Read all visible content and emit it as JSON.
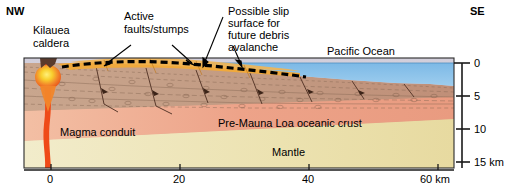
{
  "figure": {
    "type": "geologic-cross-section",
    "orientation_left": "NW",
    "orientation_right": "SE"
  },
  "annotations": {
    "nw": "NW",
    "se": "SE",
    "kilauea_caldera_line1": "Kilauea",
    "kilauea_caldera_line2": "caldera",
    "active_faults_line1": "Active",
    "active_faults_line2": "faults/stumps",
    "slip_surface_line1": "Possible slip",
    "slip_surface_line2": "surface for",
    "slip_surface_line3": "future debris",
    "slip_surface_line4": "avalanche",
    "pacific_ocean": "Pacific Ocean",
    "magma_conduit": "Magma conduit",
    "oceanic_crust": "Pre-Mauna Loa oceanic crust",
    "mantle": "Mantle"
  },
  "axes": {
    "horizontal": {
      "label_unit": "km",
      "ticks": [
        {
          "value": 0,
          "label": "0",
          "x": 51
        },
        {
          "value": 20,
          "label": "20",
          "x": 180
        },
        {
          "value": 40,
          "label": "40",
          "x": 309
        },
        {
          "value": 60,
          "label": "60 km",
          "x": 438
        }
      ],
      "range": [
        -8,
        68
      ]
    },
    "depth": {
      "label_unit": "km",
      "ticks": [
        {
          "value": 0,
          "label": "0",
          "y": 63
        },
        {
          "value": 5,
          "label": "5",
          "y": 96
        },
        {
          "value": 10,
          "label": "10",
          "y": 129
        },
        {
          "value": 15,
          "label": "15 km",
          "y": 162
        }
      ],
      "range": [
        0,
        15
      ]
    }
  },
  "layers": [
    {
      "name": "ocean-water",
      "label": "Pacific Ocean",
      "color": "#7fbce4"
    },
    {
      "name": "volcanic-edifice",
      "label": "Kilauea edifice",
      "color": "#c6a189"
    },
    {
      "name": "slump-block",
      "label": "Active faults/stumps",
      "color": "#f0a93c"
    },
    {
      "name": "oceanic-crust",
      "label": "Pre-Mauna Loa oceanic crust",
      "color": "#efac8e"
    },
    {
      "name": "lower-crust",
      "label": "lower crust",
      "color": "#eee6bb"
    },
    {
      "name": "mantle",
      "label": "Mantle",
      "color": "#ccc9d6"
    },
    {
      "name": "magma",
      "label": "Magma conduit",
      "color": "#ef4a18"
    },
    {
      "name": "magma-chamber",
      "label": "magma chamber",
      "color": "#f5c02a"
    }
  ],
  "colors": {
    "ocean": "#7fbce4",
    "edifice": "#c6a189",
    "slump": "#f0a93c",
    "crust": "#efac8e",
    "lower_crust": "#eee6bb",
    "mantle": "#ccc9d6",
    "magma": "#ef4a18",
    "magma_core": "#f7d33a",
    "slip_surface": "#000000",
    "axis": "#1a1a1a",
    "text": "#000000"
  }
}
